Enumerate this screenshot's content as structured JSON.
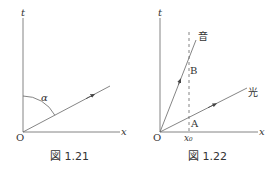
{
  "figures": [
    {
      "caption": "図 1.21",
      "axes": {
        "vertical": "t",
        "horizontal": "x",
        "origin": "O"
      },
      "angle_label": "α"
    },
    {
      "caption": "図 1.22",
      "axes": {
        "vertical": "t",
        "horizontal": "x",
        "origin": "O"
      },
      "lines": {
        "sound": "音",
        "light": "光"
      },
      "points": {
        "A": "A",
        "B": "B"
      },
      "x_marker": "x₀"
    }
  ],
  "colors": {
    "stroke": "#555555",
    "text": "#333333"
  }
}
